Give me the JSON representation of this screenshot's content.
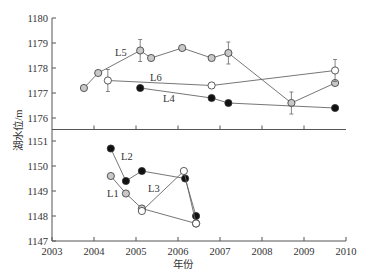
{
  "chart_data": {
    "type": "line",
    "title": "",
    "xlabel": "年份",
    "ylabel": "湖水位/m",
    "xlim": [
      2003,
      2010
    ],
    "x_ticks": [
      "2003",
      "2004",
      "2005",
      "2006",
      "2007",
      "2008",
      "2009",
      "2010"
    ],
    "broken_y_axis": true,
    "panels": [
      {
        "name": "upper",
        "ylim": [
          1175.5,
          1180
        ],
        "y_ticks": [
          "1176",
          "1177",
          "1178",
          "1179",
          "1180"
        ],
        "series": [
          {
            "name": "L5",
            "marker": "gray-filled-circle",
            "points": [
              [
                2003.76,
                1177.2
              ],
              [
                2004.1,
                1177.8
              ],
              [
                2005.1,
                1178.7
              ],
              [
                2005.36,
                1178.4
              ],
              [
                2006.1,
                1178.8
              ],
              [
                2006.8,
                1178.4
              ],
              [
                2007.2,
                1178.6
              ],
              [
                2008.7,
                1176.6
              ],
              [
                2009.74,
                1177.4
              ]
            ],
            "error_bars_at": [
              2005.1,
              2007.2,
              2008.7
            ]
          },
          {
            "name": "L6",
            "marker": "open-circle",
            "points": [
              [
                2004.33,
                1177.5
              ],
              [
                2006.8,
                1177.3
              ],
              [
                2009.74,
                1177.9
              ]
            ],
            "error_bars_at": [
              2004.33,
              2009.74
            ]
          },
          {
            "name": "L4",
            "marker": "black-filled-circle",
            "points": [
              [
                2005.1,
                1177.2
              ],
              [
                2006.8,
                1176.8
              ],
              [
                2007.2,
                1176.6
              ],
              [
                2009.74,
                1176.4
              ]
            ]
          }
        ]
      },
      {
        "name": "lower",
        "ylim": [
          1147,
          1151.5
        ],
        "y_ticks": [
          "1147",
          "1148",
          "1149",
          "1150",
          "1151"
        ],
        "series": [
          {
            "name": "L2",
            "marker": "black-filled-circle",
            "points": [
              [
                2004.4,
                1150.7
              ],
              [
                2004.76,
                1149.4
              ],
              [
                2005.14,
                1149.8
              ],
              [
                2006.17,
                1149.5
              ],
              [
                2006.43,
                1148.0
              ]
            ]
          },
          {
            "name": "L1",
            "marker": "gray-filled-circle",
            "points": [
              [
                2004.4,
                1149.6
              ],
              [
                2004.76,
                1148.9
              ],
              [
                2005.14,
                1148.3
              ],
              [
                2006.43,
                1147.7
              ]
            ]
          },
          {
            "name": "L3",
            "marker": "open-circle",
            "points": [
              [
                2005.14,
                1148.2
              ],
              [
                2006.14,
                1149.8
              ],
              [
                2006.43,
                1147.7
              ]
            ]
          }
        ]
      }
    ],
    "legend": "inline labels",
    "grid": false
  },
  "labels": {
    "xlabel": "年份",
    "ylabel": "湖水位/m",
    "L1": "L1",
    "L2": "L2",
    "L3": "L3",
    "L4": "L4",
    "L5": "L5",
    "L6": "L6"
  },
  "colors": {
    "axis": "#555555",
    "line": "#666666",
    "gray_marker": "#c8c8c8",
    "black_marker": "#111111",
    "open_marker": "#ffffff"
  }
}
